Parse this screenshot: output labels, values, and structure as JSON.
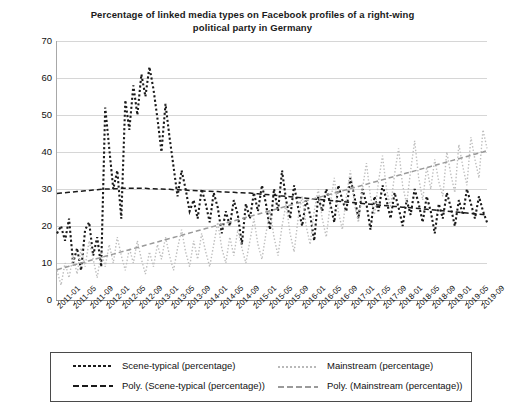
{
  "chart_data": {
    "type": "line",
    "title": "Percentage of linked media types on Facebook profiles of a right-wing political party in Germany",
    "title_line1": "Percentage of linked media types on Facebook profiles of a right-wing",
    "title_line2": "political party in Germany",
    "xlabel": "",
    "ylabel": "",
    "ylim": [
      0,
      70
    ],
    "ytick_values": [
      0,
      10,
      20,
      30,
      40,
      50,
      60,
      70
    ],
    "grid": true,
    "legend_position": "bottom",
    "xtick_labels": [
      "2011-01",
      "2011-05",
      "2011-09",
      "2012-01",
      "2012-05",
      "2012-09",
      "2013-01",
      "2013-05",
      "2013-09",
      "2014-01",
      "2014-05",
      "2014-09",
      "2015-01",
      "2015-05",
      "2015-09",
      "2016-01",
      "2016-05",
      "2016-09",
      "2017-01",
      "2017-05",
      "2017-09",
      "2018-01",
      "2018-05",
      "2018-09",
      "2019-01",
      "2019-05",
      "2019-09"
    ],
    "x_start": "2011-01",
    "x_end": "2019-12",
    "n_points": 108,
    "series": [
      {
        "name": "Scene-typical (percentage)",
        "style": "dotted",
        "color": "#1a1a1a",
        "values": [
          18,
          20,
          16,
          22,
          10,
          14,
          8,
          19,
          21,
          12,
          17,
          9,
          52,
          41,
          30,
          35,
          22,
          54,
          46,
          58,
          50,
          61,
          55,
          63,
          57,
          49,
          40,
          53,
          44,
          36,
          28,
          35,
          30,
          24,
          27,
          22,
          30,
          26,
          21,
          29,
          25,
          18,
          24,
          20,
          27,
          23,
          15,
          26,
          22,
          29,
          24,
          31,
          26,
          19,
          30,
          24,
          35,
          27,
          22,
          31,
          25,
          20,
          27,
          23,
          16,
          28,
          24,
          30,
          26,
          21,
          31,
          27,
          24,
          33,
          28,
          22,
          30,
          26,
          19,
          28,
          24,
          31,
          27,
          22,
          29,
          25,
          20,
          27,
          23,
          30,
          26,
          21,
          28,
          24,
          18,
          26,
          22,
          29,
          25,
          20,
          27,
          23,
          30,
          26,
          22,
          28,
          24,
          21
        ]
      },
      {
        "name": "Mainstream (percentage)",
        "style": "dotted-fine",
        "color": "#bdbdbd",
        "values": [
          8,
          4,
          10,
          6,
          12,
          7,
          14,
          9,
          16,
          11,
          6,
          13,
          9,
          15,
          10,
          17,
          12,
          8,
          14,
          10,
          16,
          11,
          7,
          13,
          9,
          15,
          11,
          17,
          12,
          8,
          14,
          19,
          13,
          9,
          16,
          11,
          18,
          13,
          9,
          15,
          21,
          14,
          10,
          17,
          12,
          19,
          14,
          10,
          16,
          22,
          15,
          11,
          18,
          24,
          17,
          12,
          20,
          26,
          18,
          13,
          22,
          28,
          20,
          15,
          24,
          30,
          22,
          17,
          26,
          33,
          24,
          19,
          28,
          35,
          26,
          21,
          30,
          37,
          28,
          23,
          32,
          39,
          30,
          25,
          34,
          41,
          31,
          26,
          35,
          43,
          33,
          27,
          36,
          30,
          38,
          32,
          28,
          40,
          34,
          29,
          42,
          36,
          31,
          44,
          38,
          33,
          46,
          41
        ]
      },
      {
        "name": "Poly. (Scene-typical (percentage))",
        "style": "dashed",
        "color": "#1a1a1a",
        "values": [
          28.8,
          28.9,
          29.0,
          29.1,
          29.2,
          29.3,
          29.4,
          29.5,
          29.6,
          29.7,
          29.8,
          29.9,
          30.0,
          30.0,
          30.1,
          30.1,
          30.2,
          30.2,
          30.2,
          30.2,
          30.2,
          30.2,
          30.2,
          30.1,
          30.1,
          30.0,
          30.0,
          29.9,
          29.9,
          29.8,
          29.8,
          29.7,
          29.7,
          29.6,
          29.6,
          29.5,
          29.5,
          29.4,
          29.4,
          29.3,
          29.3,
          29.2,
          29.2,
          29.1,
          29.1,
          29.0,
          29.0,
          28.9,
          28.9,
          28.8,
          28.7,
          28.6,
          28.5,
          28.4,
          28.3,
          28.2,
          28.1,
          28.0,
          27.9,
          27.8,
          27.7,
          27.6,
          27.5,
          27.4,
          27.3,
          27.2,
          27.1,
          27.0,
          26.9,
          26.8,
          26.7,
          26.6,
          26.5,
          26.4,
          26.3,
          26.2,
          26.1,
          26.0,
          25.9,
          25.8,
          25.7,
          25.6,
          25.5,
          25.4,
          25.3,
          25.2,
          25.1,
          25.0,
          24.9,
          24.8,
          24.7,
          24.6,
          24.5,
          24.4,
          24.3,
          24.2,
          24.1,
          24.0,
          23.9,
          23.8,
          23.7,
          23.6,
          23.5,
          23.4,
          23.3,
          23.2,
          23.1,
          23.0
        ]
      },
      {
        "name": "Poly. (Mainstream (percentage))",
        "style": "dashed",
        "color": "#9a9a9a",
        "values": [
          8.2,
          8.5,
          8.8,
          9.1,
          9.4,
          9.7,
          10.0,
          10.3,
          10.6,
          10.9,
          11.2,
          11.5,
          11.8,
          12.1,
          12.4,
          12.7,
          13.0,
          13.3,
          13.6,
          13.9,
          14.2,
          14.5,
          14.8,
          15.1,
          15.4,
          15.7,
          16.0,
          16.3,
          16.6,
          16.9,
          17.2,
          17.5,
          17.8,
          18.1,
          18.4,
          18.7,
          19.0,
          19.3,
          19.6,
          19.9,
          20.2,
          20.5,
          20.8,
          21.1,
          21.4,
          21.7,
          22.0,
          22.3,
          22.6,
          22.9,
          23.2,
          23.5,
          23.8,
          24.1,
          24.4,
          24.7,
          25.0,
          25.3,
          25.6,
          25.9,
          26.2,
          26.5,
          26.8,
          27.1,
          27.4,
          27.7,
          28.0,
          28.3,
          28.6,
          28.9,
          29.2,
          29.5,
          29.8,
          30.1,
          30.4,
          30.7,
          31.0,
          31.3,
          31.6,
          31.9,
          32.2,
          32.5,
          32.8,
          33.1,
          33.4,
          33.7,
          34.0,
          34.3,
          34.6,
          34.9,
          35.2,
          35.5,
          35.8,
          36.1,
          36.4,
          36.7,
          37.0,
          37.3,
          37.6,
          37.9,
          38.2,
          38.5,
          38.8,
          39.1,
          39.4,
          39.7,
          40.0,
          40.4
        ]
      }
    ]
  },
  "legend": {
    "items": [
      {
        "label": "Scene-typical (percentage)",
        "swatch": "dotted-dark"
      },
      {
        "label": "Mainstream (percentage)",
        "swatch": "dotted-light"
      },
      {
        "label": "Poly. (Scene-typical (percentage))",
        "swatch": "dashed-dark"
      },
      {
        "label": "Poly. (Mainstream (percentage))",
        "swatch": "dashed-light"
      }
    ]
  },
  "colors": {
    "scene_typical": "#1a1a1a",
    "mainstream": "#bdbdbd",
    "poly_scene_typical": "#1a1a1a",
    "poly_mainstream": "#9a9a9a",
    "grid": "#d6d6d6",
    "axis": "#8f8f8f"
  }
}
